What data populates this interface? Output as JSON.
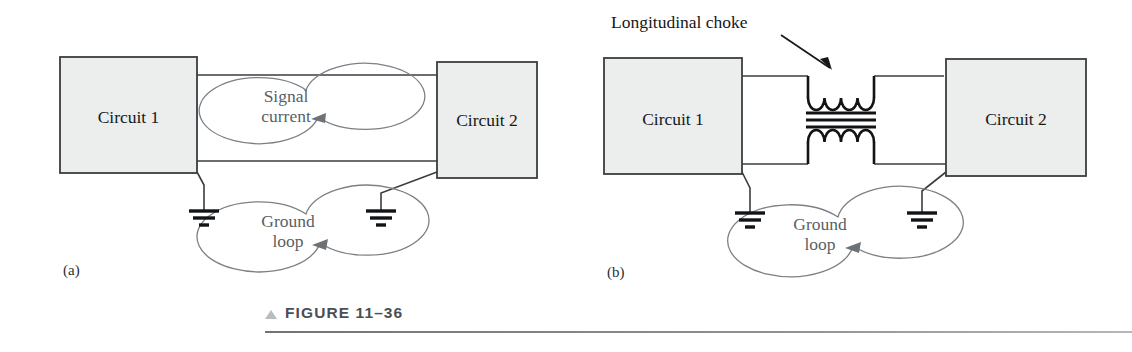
{
  "figure": {
    "caption": "FIGURE 11–36",
    "marker_icon": "triangle-up-icon",
    "rule_color": "#7b8085"
  },
  "colors": {
    "box_fill": "#eceded",
    "box_stroke": "#3a3d40",
    "wire": "#3a3d40",
    "loop_annotation": "#5a5f66",
    "text": "#15171a",
    "choke": "#111315"
  },
  "panels": [
    {
      "id": "a",
      "letter": "(a)",
      "blocks": [
        {
          "name": "circuit-1-block",
          "label": "Circuit 1"
        },
        {
          "name": "circuit-2-block",
          "label": "Circuit 2"
        }
      ],
      "annotations": [
        {
          "name": "signal-current-loop",
          "label_line1": "Signal",
          "label_line2": "current"
        },
        {
          "name": "ground-loop",
          "label_line1": "Ground",
          "label_line2": "loop"
        }
      ],
      "grounds": [
        {
          "name": "ground-symbol-left"
        },
        {
          "name": "ground-symbol-right"
        }
      ]
    },
    {
      "id": "b",
      "letter": "(b)",
      "blocks": [
        {
          "name": "circuit-1-block",
          "label": "Circuit 1"
        },
        {
          "name": "circuit-2-block",
          "label": "Circuit 2"
        }
      ],
      "callout": {
        "name": "longitudinal-choke-callout",
        "label": "Longitudinal choke"
      },
      "component": {
        "name": "longitudinal-choke",
        "coil_turns": 4,
        "core_bars": 3
      },
      "annotations": [
        {
          "name": "ground-loop",
          "label_line1": "Ground",
          "label_line2": "loop"
        }
      ],
      "grounds": [
        {
          "name": "ground-symbol-left"
        },
        {
          "name": "ground-symbol-right"
        }
      ]
    }
  ]
}
